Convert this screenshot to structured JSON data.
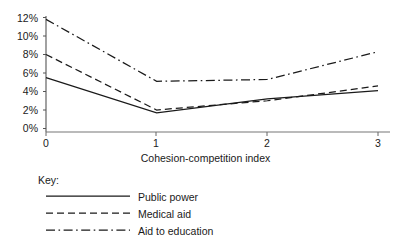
{
  "chart_data": {
    "type": "line",
    "title": "",
    "xlabel": "Cohesion-competition index",
    "ylabel": "",
    "x": [
      0,
      1,
      2,
      3
    ],
    "xlim": [
      0,
      3
    ],
    "ylim": [
      0,
      12
    ],
    "xticks": [
      "0",
      "1",
      "2",
      "3"
    ],
    "yticks": [
      "0%",
      "2%",
      "4%",
      "6%",
      "8%",
      "10%",
      "12%"
    ],
    "ytick_values": [
      0,
      2,
      4,
      6,
      8,
      10,
      12
    ],
    "grid": false,
    "legend_position": "below-plot",
    "legend_title": "Key:",
    "series": [
      {
        "name": "Public power",
        "style": "solid",
        "color": "#1a1a1a",
        "values": [
          5.5,
          1.7,
          3.2,
          4.1
        ]
      },
      {
        "name": "Medical aid",
        "style": "dashed",
        "color": "#1a1a1a",
        "values": [
          8.0,
          2.0,
          3.0,
          4.6
        ]
      },
      {
        "name": "Aid to education",
        "style": "dash-dot",
        "color": "#1a1a1a",
        "values": [
          11.8,
          5.1,
          5.3,
          8.3
        ]
      }
    ]
  },
  "axes": {
    "y_labels": [
      "12%",
      "10%",
      "8%",
      "6%",
      "4%",
      "2%",
      "0%"
    ],
    "x_labels": [
      "0",
      "1",
      "2",
      "3"
    ],
    "x_axis_title": "Cohesion-competition index"
  },
  "legend": {
    "title": "Key:",
    "entries": [
      {
        "label": "Public power",
        "style": "solid"
      },
      {
        "label": "Medical aid",
        "style": "dashed"
      },
      {
        "label": "Aid to education",
        "style": "dash-dot"
      }
    ]
  },
  "colors": {
    "ink": "#1a1a1a",
    "axis": "#4a4a4a",
    "background": "#ffffff"
  }
}
